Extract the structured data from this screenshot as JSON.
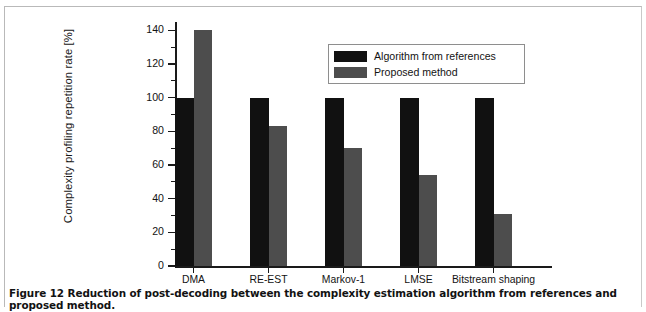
{
  "figure": {
    "caption": "Figure 12 Reduction of post-decoding between the complexity estimation algorithm from references and proposed method."
  },
  "colors": {
    "series_algorithm_from_references": "#111111",
    "series_proposed_method": "#4d4d4d",
    "axis": "#1a1a1a",
    "legend_border": "#8e8e8e",
    "frame_border": "#b9b9b9",
    "background": "#ffffff"
  },
  "chart_data": {
    "type": "bar",
    "title": "",
    "xlabel": "",
    "ylabel": "Complexity profiling repetition rate [%]",
    "categories": [
      "DMA",
      "RE-EST",
      "Markov-1",
      "LMSE",
      "Bitstream shaping"
    ],
    "series": [
      {
        "name": "Algorithm from references",
        "color": "#111111",
        "values": [
          100,
          100,
          100,
          100,
          100
        ]
      },
      {
        "name": "Proposed method",
        "color": "#4d4d4d",
        "values": [
          140,
          83,
          70,
          54,
          31
        ]
      }
    ],
    "ylim": [
      0,
      145
    ],
    "yticks": [
      0,
      20,
      40,
      60,
      80,
      100,
      120,
      140
    ],
    "ytick_labels": [
      "0",
      "20",
      "40",
      "60",
      "80",
      "100",
      "120",
      "140"
    ],
    "minor_ticks": [
      10,
      30,
      50,
      70,
      90,
      110,
      130
    ],
    "grid": false,
    "legend_position": "upper-center-right",
    "legend_entries": [
      "Algorithm from references",
      "Proposed method"
    ]
  }
}
